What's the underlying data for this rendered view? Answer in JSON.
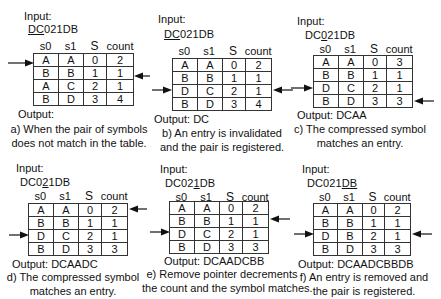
{
  "columns": [
    "s0",
    "s1",
    "S",
    "count"
  ],
  "input_label": "Input:",
  "panels": [
    {
      "id": "a",
      "input_pre": "",
      "input_underlined": "DC",
      "input_post": "021DB",
      "rows": [
        [
          "A",
          "A",
          "0",
          "2"
        ],
        [
          "B",
          "B",
          "1",
          "1"
        ],
        [
          "A",
          "C",
          "2",
          "1"
        ],
        [
          "B",
          "D",
          "3",
          "4"
        ]
      ],
      "left_arrow_row": 0,
      "right_arrow_row": 1,
      "output": "Output:",
      "caption_line1": "a) When the pair of symbols",
      "caption_line2": "does not match in the table."
    },
    {
      "id": "b",
      "input_pre": "",
      "input_underlined": "DC",
      "input_post": "021DB",
      "rows": [
        [
          "A",
          "A",
          "0",
          "2"
        ],
        [
          "B",
          "B",
          "1",
          "1"
        ],
        [
          "D",
          "C",
          "2",
          "1"
        ],
        [
          "B",
          "D",
          "3",
          "4"
        ]
      ],
      "left_arrow_row": 2,
      "right_arrow_row": 2,
      "output": "Output:  DC",
      "caption_line1": "b) An entry is invalidated",
      "caption_line2": "and the pair is registered."
    },
    {
      "id": "c",
      "input_pre": "DC",
      "input_underlined": "0",
      "input_post": "21DB",
      "rows": [
        [
          "A",
          "A",
          "0",
          "3"
        ],
        [
          "B",
          "B",
          "1",
          "1"
        ],
        [
          "D",
          "C",
          "2",
          "1"
        ],
        [
          "B",
          "D",
          "3",
          "3"
        ]
      ],
      "left_arrow_row": 2,
      "right_arrow_row": 3,
      "output": "Output:  DCAA",
      "caption_line1": "c) The compressed symbol",
      "caption_line2": "matches an entry."
    },
    {
      "id": "d",
      "input_pre": "DC0",
      "input_underlined": "2",
      "input_post": "1DB",
      "rows": [
        [
          "A",
          "A",
          "0",
          "2"
        ],
        [
          "B",
          "B",
          "1",
          "1"
        ],
        [
          "D",
          "C",
          "2",
          "1"
        ],
        [
          "B",
          "D",
          "3",
          "3"
        ]
      ],
      "left_arrow_row": 2,
      "right_arrow_row": 0,
      "output": "Output: DCAADC",
      "caption_line1": "d) The compressed symbol",
      "caption_line2": "matches an entry."
    },
    {
      "id": "e",
      "input_pre": "DC02",
      "input_underlined": "1",
      "input_post": "DB",
      "rows": [
        [
          "A",
          "A",
          "0",
          "2"
        ],
        [
          "B",
          "B",
          "1",
          "1"
        ],
        [
          "D",
          "C",
          "2",
          "1"
        ],
        [
          "B",
          "D",
          "3",
          "3"
        ]
      ],
      "left_arrow_row": 2,
      "right_arrow_row": 1,
      "output": "Output:  DCAADCBB",
      "caption_line1": "e) Remove pointer decrements",
      "caption_line2": "the count and the symbol matches."
    },
    {
      "id": "f",
      "input_pre": "DC021",
      "input_underlined": "DB",
      "input_post": "",
      "rows": [
        [
          "A",
          "A",
          "0",
          "2"
        ],
        [
          "B",
          "B",
          "1",
          "1"
        ],
        [
          "D",
          "B",
          "2",
          "1"
        ],
        [
          "B",
          "D",
          "3",
          "3"
        ]
      ],
      "left_arrow_row": 2,
      "right_arrow_row": 2,
      "output": "Output:  DCAADCBBDB",
      "caption_line1": "f) An entry is removed and",
      "caption_line2": "the pair is registered."
    }
  ]
}
